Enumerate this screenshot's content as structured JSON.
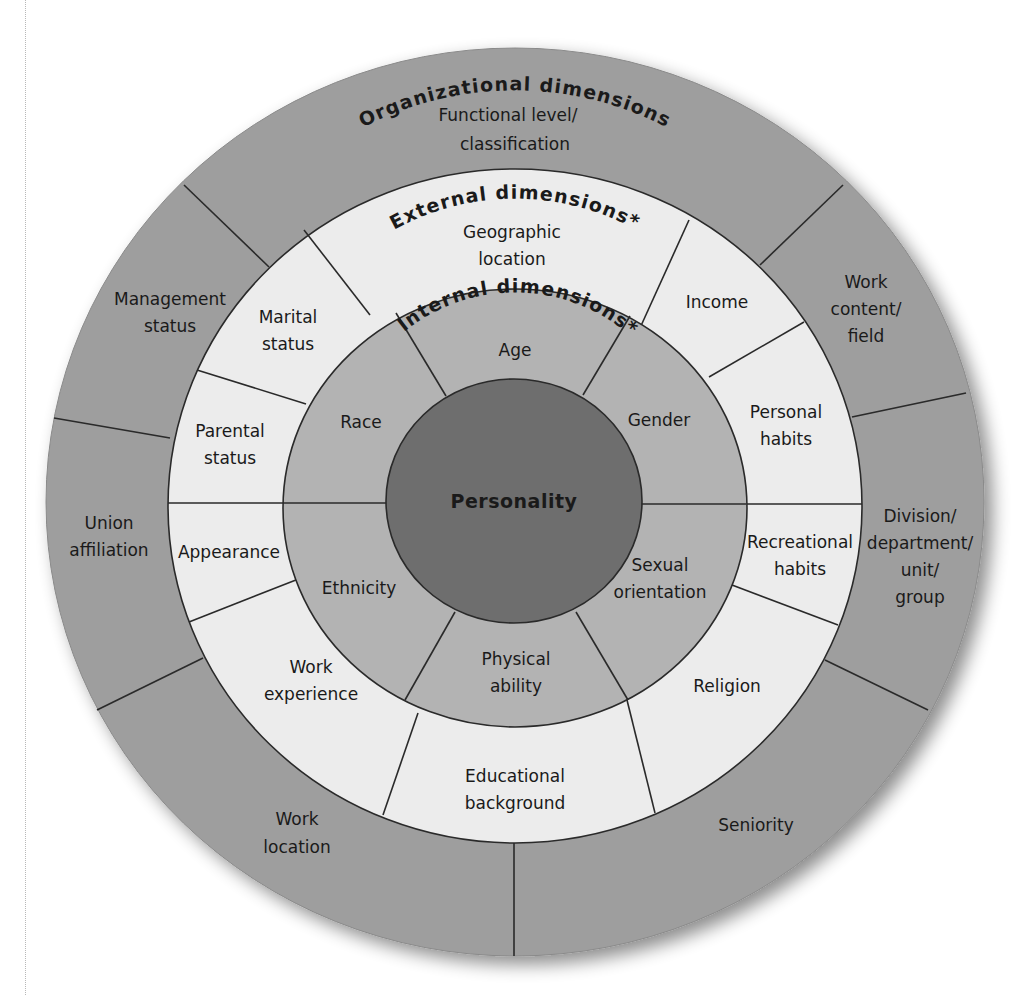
{
  "diagram": {
    "type": "concentric-wheel",
    "colors": {
      "organizational": "#9e9e9e",
      "external": "#ececec",
      "internal": "#b3b3b3",
      "core": "#6e6e6e",
      "line": "#2a2a2a"
    },
    "core": {
      "label": "Personality"
    },
    "internal": {
      "title": "Internal dimensions*",
      "segments": [
        {
          "label": [
            "Age"
          ]
        },
        {
          "label": [
            "Gender"
          ]
        },
        {
          "label": [
            "Sexual",
            "orientation"
          ]
        },
        {
          "label": [
            "Physical",
            "ability"
          ]
        },
        {
          "label": [
            "Ethnicity"
          ]
        },
        {
          "label": [
            "Race"
          ]
        }
      ]
    },
    "external": {
      "title": "External dimensions*",
      "segments": [
        {
          "label": [
            "Geographic",
            "location"
          ]
        },
        {
          "label": [
            "Income"
          ]
        },
        {
          "label": [
            "Personal",
            "habits"
          ]
        },
        {
          "label": [
            "Recreational",
            "habits"
          ]
        },
        {
          "label": [
            "Religion"
          ]
        },
        {
          "label": [
            "Educational",
            "background"
          ]
        },
        {
          "label": [
            "Work",
            "experience"
          ]
        },
        {
          "label": [
            "Appearance"
          ]
        },
        {
          "label": [
            "Parental",
            "status"
          ]
        },
        {
          "label": [
            "Marital",
            "status"
          ]
        }
      ]
    },
    "organizational": {
      "title": "Organizational dimensions",
      "segments": [
        {
          "label": [
            "Functional level/",
            "classification"
          ]
        },
        {
          "label": [
            "Work",
            "content/",
            "field"
          ]
        },
        {
          "label": [
            "Division/",
            "department/",
            "unit/",
            "group"
          ]
        },
        {
          "label": [
            "Seniority"
          ]
        },
        {
          "label": [
            "Work",
            "location"
          ]
        },
        {
          "label": [
            "Union",
            "affiliation"
          ]
        },
        {
          "label": [
            "Management",
            "status"
          ]
        }
      ]
    }
  }
}
